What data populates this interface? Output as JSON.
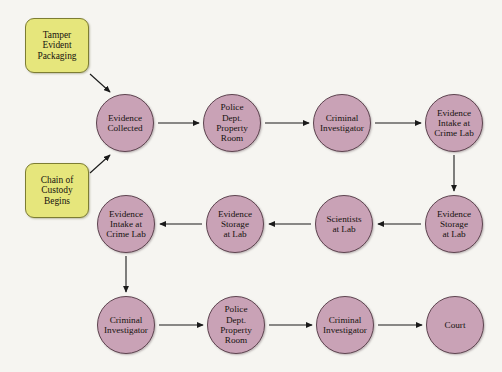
{
  "diagram": {
    "background_color": "#f6f5f1",
    "circle_fill": "#c9a2b6",
    "circle_stroke": "#5e4450",
    "box_fill": "#e6e67c",
    "box_stroke": "#7d7d33",
    "arrow_color": "#1a1a1a"
  },
  "nodes": {
    "tamper_evident_packaging": {
      "label": "Tamper\nEvident\nPackaging",
      "shape": "rounded-box",
      "x": 25,
      "y": 18,
      "w": 64,
      "h": 55
    },
    "chain_of_custody_begins": {
      "label": "Chain of\nCustody\nBegins",
      "shape": "rounded-box",
      "x": 25,
      "y": 163,
      "w": 64,
      "h": 55
    },
    "evidence_collected": {
      "label": "Evidence\nCollected",
      "shape": "circle",
      "cx": 125,
      "cy": 123,
      "r": 29
    },
    "police_property_room_1": {
      "label": "Police\nDept.\nProperty\nRoom",
      "shape": "circle",
      "cx": 232,
      "cy": 123,
      "r": 29
    },
    "criminal_investigator_1": {
      "label": "Criminal\nInvestigator",
      "shape": "circle",
      "cx": 342,
      "cy": 123,
      "r": 29
    },
    "evidence_intake_crime_lab_1": {
      "label": "Evidence\nIntake at\nCrime Lab",
      "shape": "circle",
      "cx": 454,
      "cy": 123,
      "r": 29
    },
    "evidence_storage_lab_right": {
      "label": "Evidence\nStorage\nat Lab",
      "shape": "circle",
      "cx": 454,
      "cy": 224,
      "r": 29
    },
    "scientists_at_lab": {
      "label": "Scientists\nat Lab",
      "shape": "circle",
      "cx": 344,
      "cy": 224,
      "r": 29
    },
    "evidence_storage_lab_left": {
      "label": "Evidence\nStorage\nat Lab",
      "shape": "circle",
      "cx": 235,
      "cy": 224,
      "r": 29
    },
    "evidence_intake_crime_lab_2": {
      "label": "Evidence\nIntake at\nCrime Lab",
      "shape": "circle",
      "cx": 126,
      "cy": 224,
      "r": 29
    },
    "criminal_investigator_2": {
      "label": "Criminal\nInvestigator",
      "shape": "circle",
      "cx": 126,
      "cy": 325,
      "r": 29
    },
    "police_property_room_2": {
      "label": "Police\nDept.\nProperty\nRoom",
      "shape": "circle",
      "cx": 236,
      "cy": 325,
      "r": 29
    },
    "criminal_investigator_3": {
      "label": "Criminal\nInvestigator",
      "shape": "circle",
      "cx": 345,
      "cy": 325,
      "r": 29
    },
    "court": {
      "label": "Court",
      "shape": "circle",
      "cx": 455,
      "cy": 325,
      "r": 29
    }
  },
  "edges": [
    {
      "from": "tamper_evident_packaging",
      "to": "evidence_collected",
      "style": "diagonal-down-right"
    },
    {
      "from": "chain_of_custody_begins",
      "to": "evidence_collected",
      "style": "diagonal-up-right"
    },
    {
      "from": "evidence_collected",
      "to": "police_property_room_1",
      "style": "horizontal-right"
    },
    {
      "from": "police_property_room_1",
      "to": "criminal_investigator_1",
      "style": "horizontal-right"
    },
    {
      "from": "criminal_investigator_1",
      "to": "evidence_intake_crime_lab_1",
      "style": "horizontal-right"
    },
    {
      "from": "evidence_intake_crime_lab_1",
      "to": "evidence_storage_lab_right",
      "style": "vertical-down"
    },
    {
      "from": "evidence_storage_lab_right",
      "to": "scientists_at_lab",
      "style": "horizontal-left"
    },
    {
      "from": "scientists_at_lab",
      "to": "evidence_storage_lab_left",
      "style": "horizontal-left"
    },
    {
      "from": "evidence_storage_lab_left",
      "to": "evidence_intake_crime_lab_2",
      "style": "horizontal-left"
    },
    {
      "from": "evidence_intake_crime_lab_2",
      "to": "criminal_investigator_2",
      "style": "vertical-down"
    },
    {
      "from": "criminal_investigator_2",
      "to": "police_property_room_2",
      "style": "horizontal-right"
    },
    {
      "from": "police_property_room_2",
      "to": "criminal_investigator_3",
      "style": "horizontal-right"
    },
    {
      "from": "criminal_investigator_3",
      "to": "court",
      "style": "horizontal-right"
    }
  ]
}
